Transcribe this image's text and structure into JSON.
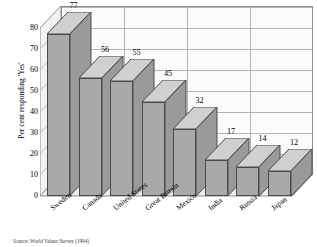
{
  "chart_data": {
    "type": "bar",
    "title": "",
    "subtitle": "",
    "xlabel": "",
    "ylabel": "Per cent responding 'Yes'",
    "categories": [
      "Sweden",
      "Canada",
      "United States",
      "Great Britain",
      "Mexico",
      "India",
      "Russia",
      "Japan"
    ],
    "values": [
      77,
      56,
      55,
      45,
      32,
      17,
      14,
      12
    ],
    "series": [
      {
        "name": "Per cent responding 'Yes'",
        "values": [
          77,
          56,
          55,
          45,
          32,
          17,
          14,
          12
        ]
      }
    ],
    "ylim": [
      0,
      80
    ],
    "yticks": [
      0,
      10,
      20,
      30,
      40,
      50,
      60,
      70,
      80
    ],
    "ytick_labels": [
      "0",
      "10",
      "20",
      "30",
      "40",
      "50",
      "60",
      "70",
      "80"
    ],
    "grid": true,
    "legend": false,
    "legend_position": "none",
    "style": "3d-column",
    "annotations": [
      "Source: World Values Survey (1994)"
    ],
    "colors": {
      "bar_front": "#a9a9a9",
      "bar_top": "#d0d0d0",
      "bar_side": "#9a9a9a",
      "bar_outline": "#4a4a4a",
      "plot_background": "#fbfbfb",
      "gridline": "#b3b3b3",
      "axis": "#8d8d8d",
      "page_background": "#ffffff",
      "text": "#000000"
    }
  },
  "source_note": "Source: World Values Survey (1994)"
}
